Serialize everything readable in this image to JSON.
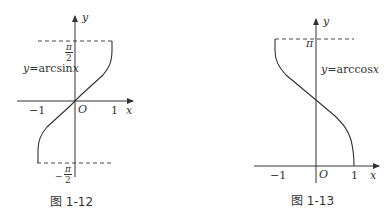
{
  "figures": [
    {
      "caption": "图 1-12",
      "function_label": "y = arcsin x",
      "function_label_parts": {
        "lhs": "y",
        "eq": "=",
        "fn": "arcsin",
        "var": "x"
      },
      "axis_labels": {
        "x": "x",
        "y": "y",
        "origin": "O"
      },
      "x_ticks": [
        "−1",
        "1"
      ],
      "y_ticks": {
        "top_num": "π",
        "top_den": "2",
        "bottom_sign": "−",
        "bottom_num": "π",
        "bottom_den": "2"
      }
    },
    {
      "caption": "图 1-13",
      "function_label": "y = arccos x",
      "function_label_parts": {
        "lhs": "y",
        "eq": "=",
        "fn": "arccos",
        "var": "x"
      },
      "axis_labels": {
        "x": "x",
        "y": "y",
        "origin": "O"
      },
      "x_ticks": [
        "−1",
        "1"
      ],
      "y_ticks": {
        "top": "π"
      }
    }
  ],
  "colors": {
    "stroke": "#333333",
    "background": "#ffffff"
  }
}
